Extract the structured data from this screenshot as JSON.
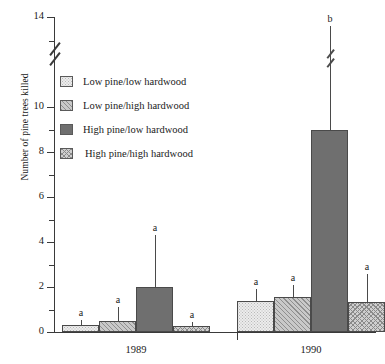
{
  "chart_data": {
    "type": "bar",
    "title": "",
    "xlabel": "",
    "ylabel": "Number of pine trees killed",
    "ylim": [
      0,
      14
    ],
    "yticks": [
      0,
      2,
      4,
      6,
      8,
      10,
      14
    ],
    "ytick_labels": [
      "0",
      "2",
      "4",
      "6",
      "8",
      "10",
      "14"
    ],
    "axis_break": {
      "between": [
        10,
        14
      ],
      "note": "y-axis break drawn between the 10 and 14 ticks"
    },
    "grid": false,
    "legend_position": "upper-left-inside",
    "categories": [
      "1989",
      "1990"
    ],
    "series": [
      {
        "name": "Low pine/low hardwood",
        "fill": "light-dotted",
        "color": "#ececec",
        "values": [
          0.3,
          1.4
        ],
        "errors_upper": [
          0.55,
          1.9
        ],
        "sig_labels": [
          "a",
          "a"
        ]
      },
      {
        "name": "Low pine/high hardwood",
        "fill": "diagonal-hatch",
        "color": "#c9c9c9",
        "values": [
          0.5,
          1.55
        ],
        "errors_upper": [
          1.1,
          2.1
        ],
        "sig_labels": [
          "a",
          "a"
        ]
      },
      {
        "name": "High pine/low hardwood",
        "fill": "solid-dark",
        "color": "#6f6f6f",
        "values": [
          2.0,
          9.0
        ],
        "errors_upper": [
          4.3,
          13.6
        ],
        "error_has_break": [
          false,
          true
        ],
        "sig_labels": [
          "a",
          "b"
        ]
      },
      {
        "name": "High pine/high hardwood",
        "fill": "cross-hatch",
        "color": "#cfcfcf",
        "values": [
          0.25,
          1.35
        ],
        "errors_upper": [
          0.45,
          2.6
        ],
        "sig_labels": [
          "a",
          "a"
        ]
      }
    ]
  },
  "legend": {
    "items": [
      {
        "label": "Low pine/low hardwood",
        "swatch": "light-dotted"
      },
      {
        "label": "Low pine/high hardwood",
        "swatch": "diagonal-hatch"
      },
      {
        "label": "High pine/low hardwood",
        "swatch": "solid-dark"
      },
      {
        "label": "High pine/high hardwood",
        "swatch": "cross-hatch"
      }
    ]
  },
  "axis": {
    "y_label": "Number of pine trees killed",
    "y_ticks": [
      "14",
      "10",
      "8",
      "6",
      "4",
      "2",
      "0"
    ],
    "x_labels": [
      "1989",
      "1990"
    ]
  }
}
